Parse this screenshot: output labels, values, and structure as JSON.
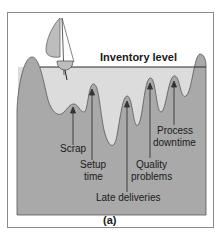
{
  "figure": {
    "title": "Inventory level",
    "caption": "(a)",
    "colors": {
      "frame_border": "#8a8a8a",
      "seabed": "#a9a9a9",
      "seabed_dark": "#8f8f8f",
      "water": "#dcdcdc",
      "sail": "#bdbdbd",
      "text": "#1a1a1a"
    },
    "labels": [
      {
        "text": "Scrap"
      },
      {
        "text": "Setup"
      },
      {
        "text": "time"
      },
      {
        "text": "Late deliveries"
      },
      {
        "text": "Quality"
      },
      {
        "text": "problems"
      },
      {
        "text": "Process"
      },
      {
        "text": "downtime"
      }
    ]
  }
}
